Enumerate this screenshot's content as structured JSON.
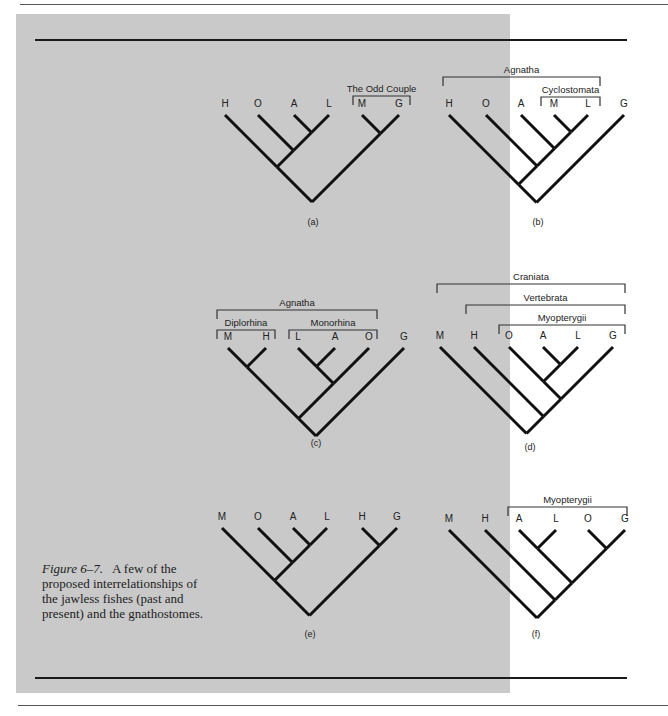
{
  "caption": {
    "figure_label": "Figure 6–7.",
    "text": "A few of the proposed interrelationships of the jawless fishes (past and present) and the gnathostomes."
  },
  "colors": {
    "background": "#c9c9c9",
    "ink": "#111111"
  },
  "panels": [
    {
      "id": "a",
      "label": "(a)",
      "label_pos": [
        313,
        225
      ],
      "top": 115,
      "leaves": [
        {
          "name": "H",
          "x": 225
        },
        {
          "name": "O",
          "x": 258
        },
        {
          "name": "A",
          "x": 294
        },
        {
          "name": "L",
          "x": 329
        },
        {
          "name": "M",
          "x": 362
        },
        {
          "name": "G",
          "x": 399
        }
      ],
      "tree": [
        [
          "H",
          [
            "O",
            [
              "A",
              "L"
            ]
          ]
        ],
        [
          "M",
          "G"
        ]
      ],
      "brackets": [
        {
          "label": "The Odd Couple",
          "x1": 353,
          "x2": 410,
          "y": 96
        }
      ]
    },
    {
      "id": "b",
      "label": "(b)",
      "label_pos": [
        538,
        225
      ],
      "top": 115,
      "leaves": [
        {
          "name": "H",
          "x": 449
        },
        {
          "name": "O",
          "x": 486
        },
        {
          "name": "A",
          "x": 521
        },
        {
          "name": "M",
          "x": 554
        },
        {
          "name": "L",
          "x": 588
        },
        {
          "name": "G",
          "x": 624
        }
      ],
      "tree": [
        [
          [
            "H",
            [
              "O",
              [
                "A",
                [
                  "M",
                  "L"
                ]
              ]
            ]
          ]
        ],
        "G"
      ],
      "brackets": [
        {
          "label": "Agnatha",
          "x1": 443,
          "x2": 600,
          "y": 77
        },
        {
          "label": "Cyclostomata",
          "x1": 541,
          "x2": 600,
          "y": 97
        }
      ]
    },
    {
      "id": "c",
      "label": "(c)",
      "label_pos": [
        316,
        446
      ],
      "top": 348,
      "leaves": [
        {
          "name": "M",
          "x": 228
        },
        {
          "name": "H",
          "x": 266
        },
        {
          "name": "L",
          "x": 298
        },
        {
          "name": "A",
          "x": 335
        },
        {
          "name": "O",
          "x": 369
        },
        {
          "name": "G",
          "x": 404
        }
      ],
      "tree": [
        [
          [
            "M",
            "H"
          ],
          [
            [
              "L",
              "A"
            ],
            "O"
          ]
        ],
        "G"
      ],
      "brackets": [
        {
          "label": "Agnatha",
          "x1": 217,
          "x2": 377,
          "y": 310
        },
        {
          "label": "Diplorhina",
          "x1": 217,
          "x2": 275,
          "y": 330
        },
        {
          "label": "Monorhina",
          "x1": 289,
          "x2": 377,
          "y": 330
        }
      ]
    },
    {
      "id": "d",
      "label": "(d)",
      "label_pos": [
        530,
        450
      ],
      "top": 347,
      "leaves": [
        {
          "name": "M",
          "x": 440
        },
        {
          "name": "H",
          "x": 474
        },
        {
          "name": "O",
          "x": 509
        },
        {
          "name": "A",
          "x": 543
        },
        {
          "name": "L",
          "x": 578
        },
        {
          "name": "G",
          "x": 613
        }
      ],
      "tree": [
        "M",
        [
          "H",
          [
            [
              "O",
              [
                "A",
                "L"
              ]
            ],
            "G"
          ]
        ]
      ],
      "brackets": [
        {
          "label": "Craniata",
          "x1": 437,
          "x2": 625,
          "y": 284
        },
        {
          "label": "Vertebrata",
          "x1": 466,
          "x2": 625,
          "y": 305
        },
        {
          "label": "Myopterygii",
          "x1": 499,
          "x2": 625,
          "y": 325
        }
      ]
    },
    {
      "id": "e",
      "label": "(e)",
      "label_pos": [
        310,
        637
      ],
      "top": 528,
      "leaves": [
        {
          "name": "M",
          "x": 222
        },
        {
          "name": "O",
          "x": 258
        },
        {
          "name": "A",
          "x": 293
        },
        {
          "name": "L",
          "x": 327
        },
        {
          "name": "H",
          "x": 362
        },
        {
          "name": "G",
          "x": 397
        }
      ],
      "tree": [
        [
          "M",
          [
            "O",
            [
              "A",
              "L"
            ]
          ]
        ],
        [
          "H",
          "G"
        ]
      ],
      "brackets": []
    },
    {
      "id": "f",
      "label": "(f)",
      "label_pos": [
        536,
        637
      ],
      "top": 530,
      "leaves": [
        {
          "name": "M",
          "x": 449
        },
        {
          "name": "H",
          "x": 485
        },
        {
          "name": "A",
          "x": 519
        },
        {
          "name": "L",
          "x": 556
        },
        {
          "name": "O",
          "x": 588
        },
        {
          "name": "G",
          "x": 625
        }
      ],
      "tree": [
        "M",
        [
          "H",
          [
            [
              "A",
              "L"
            ],
            [
              "O",
              "G"
            ]
          ]
        ]
      ],
      "brackets": [
        {
          "label": "Myopterygii",
          "x1": 508,
          "x2": 627,
          "y": 507
        }
      ]
    }
  ]
}
